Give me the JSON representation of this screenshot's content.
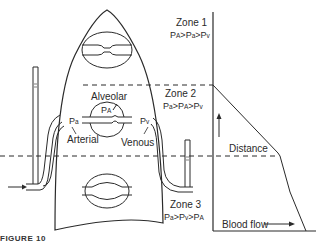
{
  "figure": {
    "caption": "FIGURE 10",
    "zones": [
      {
        "name": "Zone 1",
        "relation": [
          "P",
          "A",
          ">",
          "P",
          "a",
          ">",
          "P",
          "v"
        ]
      },
      {
        "name": "Zone 2",
        "relation": [
          "P",
          "a",
          ">",
          "P",
          "A",
          ">",
          "P",
          "v"
        ]
      },
      {
        "name": "Zone 3",
        "relation": [
          "P",
          "a",
          ">",
          "P",
          "v",
          ">",
          "P",
          "A"
        ]
      }
    ],
    "labels": {
      "alveolar": "Alveolar",
      "alveolar_pressure_p": "P",
      "alveolar_pressure_sub": "A",
      "arterial_p": "P",
      "arterial_sub": "a",
      "arterial": "Arterial",
      "venous_p": "P",
      "venous_sub": "v",
      "venous": "Venous"
    },
    "graph": {
      "y_axis_label": "Distance",
      "x_axis_label": "Blood flow"
    }
  },
  "colors": {
    "line": "#2a2a2a",
    "background": "#ffffff"
  }
}
